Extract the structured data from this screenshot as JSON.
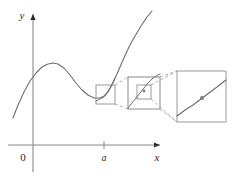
{
  "figure": {
    "background_color": "#ffffff",
    "axes": {
      "y_label": "y",
      "x_label": "x",
      "origin_label": "0",
      "tick_label": "a",
      "axis_color": "#8a8a8a",
      "label_color": "#2b2b2b",
      "x_axis_y": 145,
      "y_axis_x": 33,
      "x_axis_start": 8,
      "x_axis_end": 160,
      "y_axis_top": 14,
      "y_axis_bottom": 172,
      "tick_x": 104,
      "tick_top": 141,
      "tick_bottom": 149
    },
    "curve": {
      "color": "#6f6f6f",
      "width": 1.1,
      "description": "cubic-like curve with local max then local min then steep rise",
      "points": [
        [
          13,
          118
        ],
        [
          18,
          105
        ],
        [
          24,
          92
        ],
        [
          30,
          81
        ],
        [
          36,
          73
        ],
        [
          42,
          67
        ],
        [
          48,
          64
        ],
        [
          53,
          63
        ],
        [
          58,
          64
        ],
        [
          64,
          68
        ],
        [
          70,
          75
        ],
        [
          76,
          83
        ],
        [
          82,
          90
        ],
        [
          88,
          95
        ],
        [
          94,
          98
        ],
        [
          100,
          98
        ],
        [
          104,
          96
        ],
        [
          108,
          92
        ],
        [
          112,
          85
        ],
        [
          117,
          74
        ],
        [
          123,
          60
        ],
        [
          129,
          47
        ],
        [
          135,
          36
        ],
        [
          141,
          26
        ],
        [
          147,
          17
        ],
        [
          152,
          11
        ]
      ]
    },
    "boxes": [
      {
        "name": "magnifier-box-level-1",
        "x": 96,
        "y": 85,
        "w": 19,
        "h": 19,
        "stroke": "#9a9a9a",
        "zoom_level": 1
      },
      {
        "name": "magnifier-box-level-2-inner",
        "x": 137,
        "y": 85,
        "w": 14,
        "h": 14,
        "stroke": "#9a9a9a",
        "zoom_level": 2
      },
      {
        "name": "magnifier-box-level-2-outer",
        "x": 128,
        "y": 77,
        "w": 32,
        "h": 32,
        "stroke": "#8a8a8a",
        "zoom_level": 2
      },
      {
        "name": "magnifier-box-level-3",
        "x": 177,
        "y": 71,
        "w": 49,
        "h": 51,
        "stroke": "#9a9a9a",
        "zoom_level": 3
      }
    ],
    "connectors": {
      "color": "#9a9a9a",
      "dash": "3,2.5",
      "segments": [
        [
          115,
          85,
          128,
          77
        ],
        [
          115,
          104,
          128,
          109
        ],
        [
          160,
          77,
          177,
          71
        ],
        [
          160,
          109,
          177,
          122
        ],
        [
          151,
          85,
          177,
          71
        ],
        [
          151,
          99,
          177,
          122
        ]
      ]
    },
    "box1_curve": [
      [
        96,
        101
      ],
      [
        100,
        99
      ],
      [
        104,
        97
      ],
      [
        107,
        93
      ],
      [
        110,
        88
      ],
      [
        113,
        82
      ],
      [
        115,
        78
      ]
    ],
    "box2_curve": [
      [
        128,
        108
      ],
      [
        132,
        103
      ],
      [
        136,
        98
      ],
      [
        140,
        93
      ],
      [
        144,
        88
      ],
      [
        148,
        83
      ],
      [
        152,
        79
      ],
      [
        156,
        76
      ],
      [
        160,
        74
      ]
    ],
    "box3_curve": [
      [
        177,
        116
      ],
      [
        185,
        110
      ],
      [
        193,
        105
      ],
      [
        201,
        99
      ],
      [
        209,
        93
      ],
      [
        217,
        87
      ],
      [
        226,
        80
      ]
    ],
    "point_marker": {
      "name": "tangency-point",
      "cx": 202,
      "cy": 98,
      "r": 2.0,
      "fill": "#7d7d7d"
    },
    "point_marker_mid": {
      "name": "tangency-point-mid",
      "cx": 144,
      "cy": 91,
      "r": 1.4,
      "fill": "#7d7d7d"
    }
  }
}
